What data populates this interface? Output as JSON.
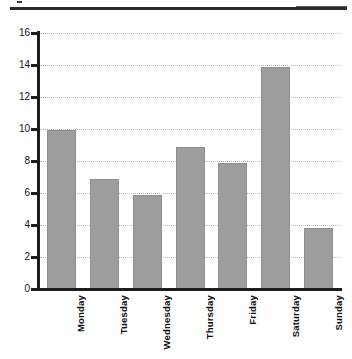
{
  "chart_data": {
    "type": "bar",
    "title": "",
    "xlabel": "",
    "ylabel": "",
    "categories": [
      "Monday",
      "Tuesday",
      "Wednesday",
      "Thursday",
      "Friday",
      "Saturday",
      "Sunday"
    ],
    "values": [
      9.95,
      6.9,
      5.85,
      8.9,
      7.9,
      13.85,
      3.8
    ],
    "ylim": [
      0,
      16
    ],
    "ytick_labels": [
      "0",
      "2",
      "4",
      "6",
      "8",
      "10",
      "12",
      "14",
      "16"
    ],
    "ytick_values": [
      0,
      2,
      4,
      6,
      8,
      10,
      12,
      14,
      16
    ],
    "grid": true,
    "grid_style": "dotted-horizontal",
    "legend": null,
    "legend_position": "none",
    "bar_color": "#9d9d9d",
    "axis_color": "#1d1d1d",
    "gridline_color": "#b9b9b9",
    "label_rotation": -90
  },
  "decoration": {
    "top_rule_color": "#2b2b2b"
  }
}
